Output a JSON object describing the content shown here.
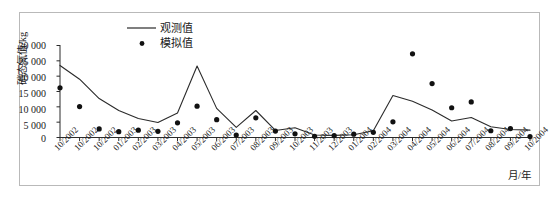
{
  "figure": {
    "y_axis_title": "硝态氮值/kg",
    "x_axis_title": "月/年"
  },
  "legend": {
    "series_line_label": "观测值",
    "series_dot_label": "模拟值"
  },
  "axis": {
    "y_ticks": [
      "30 000",
      "25 000",
      "20 000",
      "15 000",
      "10 000",
      "5 000",
      "0"
    ]
  },
  "colors": {
    "line": "#2b2b2b",
    "marker": "#111111",
    "axis": "#2b2b2b",
    "frame": "#b9b9b9",
    "background": "#ffffff"
  },
  "chart_data": {
    "type": "line",
    "title": "",
    "xlabel": "月/年",
    "ylabel": "硝态氮值/kg",
    "ylim": [
      0,
      30000
    ],
    "ytick_values": [
      0,
      5000,
      10000,
      15000,
      20000,
      25000,
      30000
    ],
    "grid": false,
    "legend_position": "top-center",
    "categories": [
      "10/2002",
      "10/2002",
      "10/2002",
      "01/2003",
      "02/2003",
      "03/2003",
      "04/2003",
      "05/2003",
      "06/2003",
      "07/2003",
      "08/2003",
      "09/2003",
      "10/2003",
      "11/2003",
      "12/2003",
      "01/2004",
      "02/2004",
      "03/2004",
      "04/2004",
      "05/2004",
      "06/2004",
      "07/2004",
      "08/2004",
      "09/2004",
      "10/2004"
    ],
    "series": [
      {
        "name": "观测值",
        "render": "line",
        "values": [
          23500,
          19000,
          12700,
          8800,
          6200,
          4900,
          8000,
          23300,
          9500,
          3300,
          8800,
          2300,
          3200,
          800,
          700,
          900,
          2200,
          13700,
          11800,
          9000,
          5400,
          6500,
          3500,
          2600,
          2400
        ]
      },
      {
        "name": "模拟值",
        "render": "scatter",
        "values": [
          16200,
          10100,
          2800,
          1900,
          2400,
          2000,
          4800,
          10200,
          5800,
          800,
          6400,
          2100,
          1200,
          400,
          600,
          1100,
          1700,
          5100,
          27300,
          17600,
          9700,
          11600,
          2200,
          2900,
          300
        ]
      }
    ]
  }
}
